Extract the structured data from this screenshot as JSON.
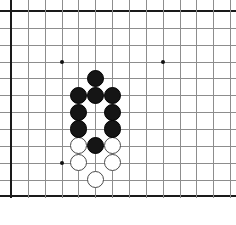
{
  "figure": {
    "kind": "go-board-diagram",
    "background_color": "#ffffff"
  },
  "board": {
    "origin_x": 11,
    "origin_y": 11,
    "cell_size": 16.85,
    "columns_visible": 14,
    "rows_visible": 12,
    "line_color": "#8d8d8d",
    "edge_color": "#1a1a1a",
    "edge_width": 2,
    "line_width": 1,
    "grid_on": true,
    "edges": {
      "left": true,
      "top": true,
      "bottom": true,
      "right": false
    }
  },
  "star_points": {
    "label": "hoshi",
    "color": "#111111",
    "radius": 2,
    "points": [
      {
        "col": 3,
        "row": 3
      },
      {
        "col": 9,
        "row": 3
      },
      {
        "col": 3,
        "row": 9
      }
    ]
  },
  "stones": {
    "radius": 8.6,
    "black_color": "#151515",
    "white_color": "#ffffff",
    "white_outline_color": "#4a4a4a",
    "black": [
      {
        "col": 5,
        "row": 4
      },
      {
        "col": 4,
        "row": 5
      },
      {
        "col": 5,
        "row": 5
      },
      {
        "col": 6,
        "row": 5
      },
      {
        "col": 4,
        "row": 6
      },
      {
        "col": 6,
        "row": 6
      },
      {
        "col": 4,
        "row": 7
      },
      {
        "col": 6,
        "row": 7
      },
      {
        "col": 5,
        "row": 8
      }
    ],
    "white": [
      {
        "col": 4,
        "row": 8
      },
      {
        "col": 6,
        "row": 8
      },
      {
        "col": 4,
        "row": 9
      },
      {
        "col": 6,
        "row": 9
      },
      {
        "col": 5,
        "row": 10
      }
    ],
    "black_count": 9,
    "white_count": 5
  },
  "chart_data": {
    "type": "table",
    "xlabel": "board column",
    "ylabel": "board row",
    "grid": true,
    "legend": [],
    "categories": [
      "black",
      "white"
    ],
    "values": [
      9,
      5
    ],
    "annotations": [
      "black stone at column 5, row 4",
      "black stones at columns 4,5,6 on row 5",
      "black stones at columns 4 and 6 on row 6",
      "black stones at columns 4 and 6 on row 7",
      "black stone at column 5, row 8",
      "white stones at columns 4 and 6 on row 8",
      "white stones at columns 4 and 6 on row 9",
      "white stone at column 5, row 10",
      "star points at (3,3), (9,3), (3,9)"
    ]
  }
}
